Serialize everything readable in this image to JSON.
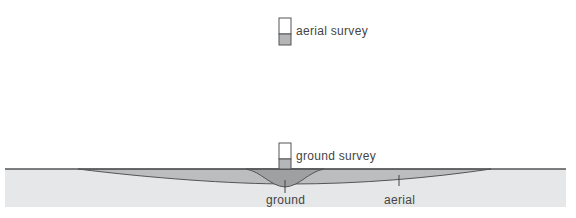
{
  "legend": {
    "aerial": {
      "label": "aerial survey"
    },
    "ground": {
      "label": "ground survey"
    }
  },
  "annotations": {
    "ground": "ground",
    "aerial": "aerial"
  },
  "colors": {
    "soil": "#e6e7e9",
    "surface_line": "#555555",
    "aerial_zone": "#b9babc",
    "ground_zone": "#9fa0a2",
    "icon_fill": "#b5b6b8"
  }
}
